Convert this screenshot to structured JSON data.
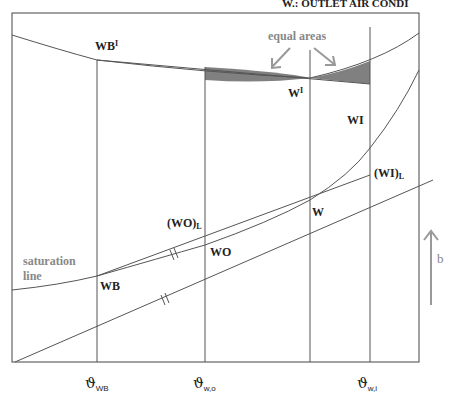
{
  "header": {
    "partial_text": "W.: OUTLET AIR CONDI"
  },
  "labels": {
    "equal_areas": "equal areas",
    "wb_prime": "WB",
    "wb_prime_sup": "I",
    "w_prime": "W",
    "w_prime_sup": "I",
    "wi": "WI",
    "wi_l": "(WI)",
    "wi_l_sub": "L",
    "w": "W",
    "wo_l": "(WO)",
    "wo_l_sub": "L",
    "wo": "WO",
    "wb": "WB",
    "saturation_line_1": "saturation",
    "saturation_line_2": "line",
    "b": "b"
  },
  "axis": {
    "ticks": [
      {
        "symbol": "ϑ",
        "sub": "WB"
      },
      {
        "symbol": "ϑ",
        "sub": "w,o"
      },
      {
        "symbol": "ϑ",
        "sub": "w,i"
      }
    ]
  },
  "colors": {
    "line": "#555555",
    "shade": "#808080",
    "arrow": "#999999"
  }
}
